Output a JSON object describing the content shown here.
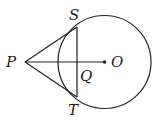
{
  "diagram": {
    "type": "geometry",
    "colors": {
      "stroke": "#222222",
      "background": "#ffffff"
    },
    "circle": {
      "center_label": "O",
      "cx": 104.5,
      "cy": 62,
      "r": 46.5
    },
    "points": {
      "P": {
        "label": "P",
        "x": 25,
        "y": 62
      },
      "S": {
        "label": "S",
        "x": 77,
        "y": 27
      },
      "T": {
        "label": "T",
        "x": 77,
        "y": 97
      },
      "Q": {
        "label": "Q",
        "x": 77,
        "y": 62
      },
      "O": {
        "label": "O",
        "x": 104.5,
        "y": 62
      }
    },
    "segments": [
      "PS",
      "PT",
      "PO",
      "ST"
    ],
    "labels": {
      "P": "P",
      "S": "S",
      "T": "T",
      "Q": "Q",
      "O": "O"
    }
  }
}
